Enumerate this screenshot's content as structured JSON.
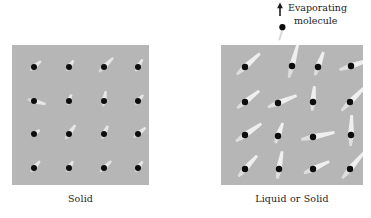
{
  "figure": {
    "background_color": "#ffffff",
    "panel_fill_color": "#b6b6b6",
    "molecule_color": "#0d0d0d",
    "vibration_streak_color": "#f2f2f2",
    "text_color": "#1b1b1b"
  },
  "panels": [
    {
      "id": "solid",
      "caption": "Solid",
      "grid": {
        "rows": 4,
        "cols": 4
      },
      "molecule_positions": [
        [
          22,
          22
        ],
        [
          57,
          22
        ],
        [
          92,
          22
        ],
        [
          126,
          22
        ],
        [
          22,
          56
        ],
        [
          57,
          56
        ],
        [
          92,
          56
        ],
        [
          126,
          56
        ],
        [
          22,
          89
        ],
        [
          57,
          89
        ],
        [
          92,
          89
        ],
        [
          126,
          89
        ],
        [
          22,
          123
        ],
        [
          57,
          123
        ],
        [
          92,
          123
        ],
        [
          126,
          123
        ]
      ],
      "vibration_streaks": [
        {
          "x": 22,
          "y": 22,
          "angle": -40,
          "length": 9
        },
        {
          "x": 57,
          "y": 22,
          "angle": -55,
          "length": 8
        },
        {
          "x": 92,
          "y": 22,
          "angle": -45,
          "length": 13
        },
        {
          "x": 126,
          "y": 22,
          "angle": -60,
          "length": 9
        },
        {
          "x": 22,
          "y": 56,
          "angle": 15,
          "length": 12
        },
        {
          "x": 57,
          "y": 56,
          "angle": -70,
          "length": 7
        },
        {
          "x": 92,
          "y": 56,
          "angle": -80,
          "length": 10
        },
        {
          "x": 126,
          "y": 56,
          "angle": -50,
          "length": 8
        },
        {
          "x": 22,
          "y": 89,
          "angle": -35,
          "length": 7
        },
        {
          "x": 57,
          "y": 89,
          "angle": -55,
          "length": 11
        },
        {
          "x": 92,
          "y": 89,
          "angle": -65,
          "length": 9
        },
        {
          "x": 126,
          "y": 89,
          "angle": -40,
          "length": 10
        },
        {
          "x": 22,
          "y": 123,
          "angle": -50,
          "length": 9
        },
        {
          "x": 57,
          "y": 123,
          "angle": -60,
          "length": 8
        },
        {
          "x": 92,
          "y": 123,
          "angle": -45,
          "length": 10
        },
        {
          "x": 126,
          "y": 123,
          "angle": -55,
          "length": 8
        }
      ]
    },
    {
      "id": "liquid-or-solid",
      "caption": "Liquid or Solid",
      "grid": {
        "rows": 4,
        "cols": 4
      },
      "molecule_positions": [
        [
          24,
          22
        ],
        [
          71,
          21
        ],
        [
          97,
          22
        ],
        [
          130,
          21
        ],
        [
          24,
          57
        ],
        [
          57,
          58
        ],
        [
          92,
          57
        ],
        [
          129,
          57
        ],
        [
          24,
          90
        ],
        [
          57,
          91
        ],
        [
          92,
          92
        ],
        [
          130,
          90
        ],
        [
          24,
          124
        ],
        [
          58,
          124
        ],
        [
          92,
          124
        ],
        [
          129,
          124
        ]
      ],
      "vibration_streaks": [
        {
          "x": 24,
          "y": 22,
          "angle": -42,
          "length": 20
        },
        {
          "x": 71,
          "y": 21,
          "angle": -75,
          "length": 22
        },
        {
          "x": 97,
          "y": 22,
          "angle": -70,
          "length": 16
        },
        {
          "x": 130,
          "y": 21,
          "angle": -18,
          "length": 22
        },
        {
          "x": 24,
          "y": 57,
          "angle": -38,
          "length": 18
        },
        {
          "x": 57,
          "y": 58,
          "angle": -22,
          "length": 20
        },
        {
          "x": 92,
          "y": 57,
          "angle": -85,
          "length": 16
        },
        {
          "x": 129,
          "y": 57,
          "angle": -45,
          "length": 22
        },
        {
          "x": 24,
          "y": 90,
          "angle": -35,
          "length": 20
        },
        {
          "x": 57,
          "y": 91,
          "angle": -70,
          "length": 14
        },
        {
          "x": 92,
          "y": 92,
          "angle": -12,
          "length": 22
        },
        {
          "x": 130,
          "y": 90,
          "angle": -88,
          "length": 20
        },
        {
          "x": 24,
          "y": 124,
          "angle": -48,
          "length": 18
        },
        {
          "x": 58,
          "y": 124,
          "angle": -80,
          "length": 18
        },
        {
          "x": 92,
          "y": 124,
          "angle": -25,
          "length": 18
        },
        {
          "x": 129,
          "y": 124,
          "angle": -50,
          "length": 22
        }
      ]
    }
  ],
  "annotation": {
    "line1": "Evaporating",
    "line2": "molecule",
    "arrow_direction": "up"
  }
}
